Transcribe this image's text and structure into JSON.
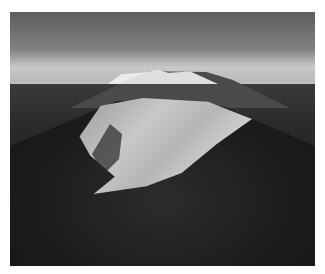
{
  "image": {
    "description": "Aerial black-and-white photograph of a large landslide scar on a forested hill, with a snow-capped volcano on the horizon under a cloudy sky",
    "subjects": [
      "landslide scar",
      "forested hillside",
      "snow-capped volcano",
      "cloudy sky",
      "plain"
    ]
  }
}
